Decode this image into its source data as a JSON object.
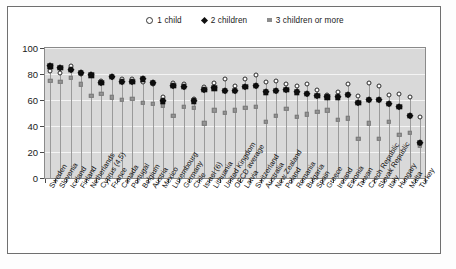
{
  "legend": {
    "position": "top-center",
    "items": [
      {
        "label": "1 child",
        "marker": "open-circle-icon",
        "color": "#ffffff"
      },
      {
        "label": "2 children",
        "marker": "filled-diamond-icon",
        "color": "#0d0d0d"
      },
      {
        "label": "3 children or more",
        "marker": "filled-square-icon",
        "color": "#949494"
      }
    ]
  },
  "axes": {
    "y_ticks": [
      "0",
      "20",
      "40",
      "60",
      "80",
      "100"
    ],
    "y_min": 0,
    "y_max": 100
  },
  "chart_data": {
    "type": "scatter",
    "title": "",
    "subtitle": "",
    "xlabel": "",
    "ylabel": "",
    "ylim": [
      0,
      100
    ],
    "grid": true,
    "legend_position": "top-center",
    "categories": [
      "Sweden",
      "Slovenia",
      "Iceland",
      "Finland",
      "Netherlands",
      "Cyprus (4,5)",
      "France",
      "Canada",
      "Portugal",
      "Belgium",
      "Austria",
      "Mexico",
      "Luxembourg",
      "Germany",
      "Chile",
      "Israel (6)",
      "Lithuania",
      "United Kingdom",
      "OECD average",
      "Latvia",
      "Switzerland",
      "Australia",
      "New Zealand",
      "Poland",
      "Romania",
      "Bulgaria",
      "Spain",
      "Greece",
      "Ireland",
      "Estonia",
      "Taiwan",
      "Czech Republic",
      "Slovak Republic",
      "Italy",
      "Hungary",
      "Malta",
      "Turkey"
    ],
    "series": [
      {
        "name": "1 child",
        "marker": "open-circle",
        "values": [
          82,
          81,
          86,
          80,
          79,
          75,
          78,
          76,
          76,
          74,
          72,
          62,
          73,
          72,
          61,
          70,
          73,
          76,
          71,
          76,
          79,
          74,
          75,
          72,
          71,
          72,
          68,
          64,
          66,
          72,
          63,
          73,
          71,
          64,
          65,
          62,
          47
        ]
      },
      {
        "name": "2 children",
        "marker": "filled-diamond",
        "values": [
          86,
          85,
          83,
          81,
          79,
          73,
          78,
          74,
          74,
          76,
          73,
          59,
          71,
          70,
          59,
          68,
          69,
          67,
          67,
          70,
          71,
          66,
          67,
          68,
          66,
          65,
          63,
          62,
          62,
          64,
          58,
          60,
          60,
          57,
          55,
          48,
          27
        ]
      },
      {
        "name": "3 children or more",
        "marker": "filled-square",
        "values": [
          75,
          74,
          77,
          72,
          63,
          65,
          62,
          60,
          61,
          58,
          57,
          56,
          48,
          55,
          54,
          42,
          52,
          50,
          52,
          54,
          55,
          43,
          48,
          53,
          47,
          49,
          51,
          52,
          45,
          46,
          30,
          42,
          30,
          43,
          33,
          35,
          25
        ]
      }
    ]
  }
}
